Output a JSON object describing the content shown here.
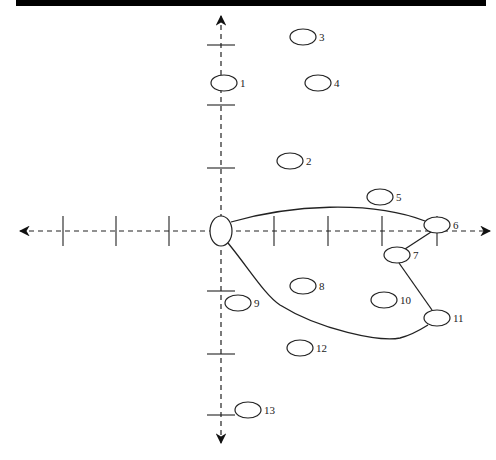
{
  "diagram": {
    "type": "coordinate-graph",
    "axes": {
      "x_arrows": "both",
      "y_arrows": "both",
      "style": "dashed"
    },
    "origin": {
      "x": 221,
      "y": 231
    },
    "nodes": [
      {
        "id": "0",
        "label": "",
        "cx": 221,
        "cy": 231,
        "rx": 11,
        "ry": 15
      },
      {
        "id": "1",
        "label": "1",
        "cx": 224,
        "cy": 83,
        "rx": 13,
        "ry": 8
      },
      {
        "id": "2",
        "label": "2",
        "cx": 290,
        "cy": 161,
        "rx": 13,
        "ry": 8
      },
      {
        "id": "3",
        "label": "3",
        "cx": 303,
        "cy": 37,
        "rx": 13,
        "ry": 8
      },
      {
        "id": "4",
        "label": "4",
        "cx": 318,
        "cy": 83,
        "rx": 13,
        "ry": 8
      },
      {
        "id": "5",
        "label": "5",
        "cx": 380,
        "cy": 197,
        "rx": 13,
        "ry": 8
      },
      {
        "id": "6",
        "label": "6",
        "cx": 437,
        "cy": 225,
        "rx": 13,
        "ry": 8
      },
      {
        "id": "7",
        "label": "7",
        "cx": 397,
        "cy": 255,
        "rx": 13,
        "ry": 8
      },
      {
        "id": "8",
        "label": "8",
        "cx": 303,
        "cy": 286,
        "rx": 13,
        "ry": 8
      },
      {
        "id": "9",
        "label": "9",
        "cx": 238,
        "cy": 303,
        "rx": 13,
        "ry": 8
      },
      {
        "id": "10",
        "label": "10",
        "cx": 384,
        "cy": 300,
        "rx": 13,
        "ry": 8
      },
      {
        "id": "11",
        "label": "11",
        "cx": 437,
        "cy": 318,
        "rx": 13,
        "ry": 8
      },
      {
        "id": "12",
        "label": "12",
        "cx": 300,
        "cy": 348,
        "rx": 13,
        "ry": 8
      },
      {
        "id": "13",
        "label": "13",
        "cx": 248,
        "cy": 410,
        "rx": 13,
        "ry": 8
      }
    ],
    "edges": [
      {
        "from": "0",
        "to": "6",
        "path": "M 231 222 C 290 205, 370 200, 425 221"
      },
      {
        "from": "6",
        "to": "7",
        "path": "M 431 232 L 405 249"
      },
      {
        "from": "7",
        "to": "11",
        "path": "M 399 263 L 432 310"
      },
      {
        "from": "0",
        "to": "11",
        "path": "M 228 243 C 250 270, 265 295, 280 305 C 320 330, 380 342, 400 338 C 412 335, 420 330, 428 325"
      }
    ],
    "x_ticks": [
      63,
      116,
      169,
      274,
      328,
      382,
      437
    ],
    "y_ticks": [
      45,
      105,
      168,
      291,
      354,
      415
    ]
  }
}
